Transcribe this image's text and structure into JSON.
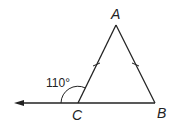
{
  "diagram": {
    "type": "geometry-triangle",
    "vertices": [
      {
        "label": "A",
        "x": 116,
        "y": 25
      },
      {
        "label": "B",
        "x": 155,
        "y": 103
      },
      {
        "label": "C",
        "x": 78,
        "y": 103
      }
    ],
    "labels": {
      "A": "A",
      "B": "B",
      "C": "C"
    },
    "exterior_angle": {
      "vertex": "C",
      "value": "110°"
    },
    "congruent_sides": [
      "AC",
      "BC_is_not",
      "AB"
    ],
    "tick_marks": [
      "CA",
      "AB"
    ],
    "ray": {
      "from": "C",
      "direction": "left",
      "arrow": true
    },
    "colors": {
      "stroke": "#222222",
      "background": "#ffffff"
    }
  }
}
